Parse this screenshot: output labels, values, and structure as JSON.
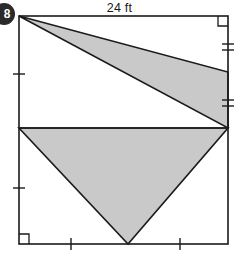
{
  "problem": {
    "number": "8"
  },
  "figure": {
    "top_dimension_label": "24 ft",
    "shape": "rectangle-with-two-shaded-triangles",
    "stroke_color": "#1a1a1a",
    "shade_color": "#c9c9c9",
    "background_color": "#ffffff",
    "rectangle": {
      "left": 19,
      "top": 16,
      "right": 228,
      "bottom": 244
    },
    "midline": {
      "from": [
        19,
        128
      ],
      "to": [
        228,
        128
      ]
    },
    "upper_triangle": {
      "name": "upper-shaded-triangle",
      "vertices": [
        [
          19,
          16
        ],
        [
          228,
          72
        ],
        [
          228,
          128
        ]
      ]
    },
    "lower_triangle": {
      "name": "lower-shaded-triangle",
      "vertices": [
        [
          19,
          128
        ],
        [
          228,
          128
        ],
        [
          128,
          244
        ]
      ]
    },
    "right_angle_markers": [
      {
        "name": "right-angle-top-right",
        "corner": "top-right"
      },
      {
        "name": "right-angle-bottom-left",
        "corner": "bottom-left"
      }
    ],
    "tick_marks": [
      {
        "name": "tick-left-upper",
        "edge": "left",
        "count": 1,
        "position": [
          19,
          74
        ]
      },
      {
        "name": "tick-left-lower",
        "edge": "left",
        "count": 1,
        "position": [
          19,
          188
        ]
      },
      {
        "name": "tick-right-upper",
        "edge": "right",
        "count": 2,
        "position": [
          228,
          47
        ]
      },
      {
        "name": "tick-right-lower",
        "edge": "right",
        "count": 2,
        "position": [
          228,
          103
        ]
      },
      {
        "name": "tick-bottom-left",
        "edge": "bottom",
        "count": 1,
        "position": [
          71,
          244
        ]
      },
      {
        "name": "tick-bottom-right",
        "edge": "bottom",
        "count": 1,
        "position": [
          180,
          244
        ]
      }
    ]
  },
  "chart_data": {
    "type": "diagram",
    "title": "24 ft",
    "labels": [
      "24 ft"
    ]
  }
}
